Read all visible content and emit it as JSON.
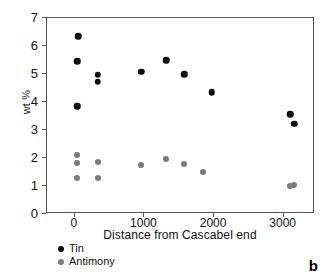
{
  "chart_data": {
    "type": "scatter",
    "title": "",
    "panel_label": "b",
    "xlabel": "Distance from Cascabel end",
    "ylabel": "wt %",
    "xlim": [
      -400,
      3450
    ],
    "ylim": [
      0,
      7
    ],
    "xticks": [
      0,
      1000,
      2000,
      3000
    ],
    "xtick_labels": [
      "0",
      "1000",
      "2000",
      "3000"
    ],
    "yticks": [
      0,
      1,
      2,
      3,
      4,
      5,
      6,
      7
    ],
    "ytick_labels": [
      "0",
      "1",
      "2",
      "3",
      "4",
      "5",
      "6",
      "7"
    ],
    "grid": false,
    "legend_position": "below-left",
    "series": [
      {
        "name": "Tin",
        "color": "#0d0d0d",
        "points": [
          {
            "x": 60,
            "y": 6.31
          },
          {
            "x": 50,
            "y": 5.42
          },
          {
            "x": 50,
            "y": 3.81
          },
          {
            "x": 340,
            "y": 4.93
          },
          {
            "x": 340,
            "y": 4.68
          },
          {
            "x": 965,
            "y": 5.05
          },
          {
            "x": 1330,
            "y": 5.46
          },
          {
            "x": 1585,
            "y": 4.96
          },
          {
            "x": 1980,
            "y": 4.32
          },
          {
            "x": 3110,
            "y": 3.52
          },
          {
            "x": 3165,
            "y": 3.18
          }
        ]
      },
      {
        "name": "Antimony",
        "color": "#7b7b7b",
        "points": [
          {
            "x": 50,
            "y": 2.06
          },
          {
            "x": 50,
            "y": 1.79
          },
          {
            "x": 50,
            "y": 1.26
          },
          {
            "x": 340,
            "y": 1.83
          },
          {
            "x": 340,
            "y": 1.25
          },
          {
            "x": 960,
            "y": 1.72
          },
          {
            "x": 1330,
            "y": 1.92
          },
          {
            "x": 1585,
            "y": 1.74
          },
          {
            "x": 1860,
            "y": 1.46
          },
          {
            "x": 3100,
            "y": 0.97
          },
          {
            "x": 3160,
            "y": 1.0
          }
        ]
      }
    ]
  },
  "legend": {
    "items": [
      {
        "label": "Tin",
        "color": "#0d0d0d"
      },
      {
        "label": "Antimony",
        "color": "#7b7b7b"
      }
    ]
  }
}
